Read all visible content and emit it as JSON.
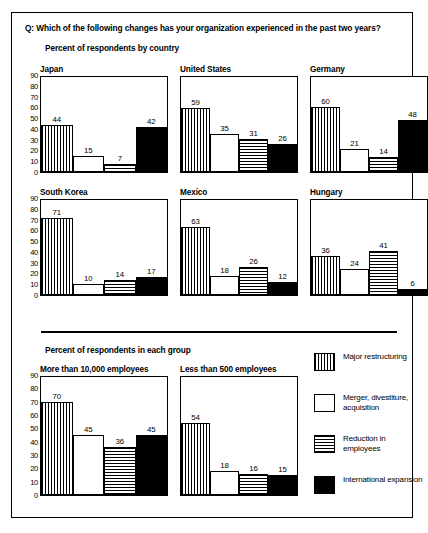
{
  "question": "Q: Which of the following changes has your organization experienced in the past two years?",
  "section_by_country": "Percent of respondents by country",
  "section_by_group": "Percent of respondents in each group",
  "axis": {
    "ticks": [
      "90",
      "80",
      "70",
      "60",
      "50",
      "40",
      "30",
      "20",
      "10",
      "0"
    ],
    "min": 0,
    "max": 90,
    "step": 10
  },
  "legend": [
    {
      "pattern": "vstripe",
      "label": "Major restructuring"
    },
    {
      "pattern": "plain",
      "label": "Merger, divestiture, acquisition"
    },
    {
      "pattern": "hstripe",
      "label": "Reduction in employees"
    },
    {
      "pattern": "solid",
      "label": "International expansion"
    }
  ],
  "chart_data": {
    "type": "bar",
    "title": "Q: Which of the following changes has your organization experienced in the past two years?",
    "xlabel": "",
    "ylabel": "Percent of respondents",
    "ylim": [
      0,
      90
    ],
    "ytick_step": 10,
    "grid": false,
    "legend_position": "right",
    "categories": [
      "Major restructuring",
      "Merger, divestiture, acquisition",
      "Reduction in employees",
      "International expansion"
    ],
    "panels": [
      {
        "group": "by-country",
        "name": "Japan",
        "values": [
          44,
          15,
          7,
          42
        ]
      },
      {
        "group": "by-country",
        "name": "United States",
        "values": [
          59,
          35,
          31,
          26
        ]
      },
      {
        "group": "by-country",
        "name": "Germany",
        "values": [
          60,
          21,
          14,
          48
        ]
      },
      {
        "group": "by-country",
        "name": "South Korea",
        "values": [
          71,
          10,
          14,
          17
        ]
      },
      {
        "group": "by-country",
        "name": "Mexico",
        "values": [
          63,
          18,
          26,
          12
        ]
      },
      {
        "group": "by-country",
        "name": "Hungary",
        "values": [
          36,
          24,
          41,
          6
        ]
      },
      {
        "group": "by-group",
        "name": "More than 10,000 employees",
        "values": [
          70,
          45,
          36,
          45
        ]
      },
      {
        "group": "by-group",
        "name": "Less than 500 employees",
        "values": [
          54,
          18,
          16,
          15
        ]
      }
    ]
  }
}
